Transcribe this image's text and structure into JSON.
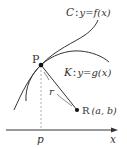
{
  "diagram": {
    "curve_c": {
      "name": "C",
      "sep": ":",
      "equation": "y=f(x)",
      "label": "C : y=f(x)"
    },
    "curve_k": {
      "name": "K",
      "sep": ":",
      "equation": "y=g(x)",
      "label": "K : y=g(x)"
    },
    "point_p": {
      "label": "P"
    },
    "point_r": {
      "label": "R",
      "coords": "(a, b)"
    },
    "segment": {
      "label": "r"
    },
    "axis": {
      "label": "x",
      "tick_label": "p"
    },
    "colors": {
      "stroke": "#333333",
      "dashed": "#888888",
      "background": "#ffffff"
    }
  }
}
